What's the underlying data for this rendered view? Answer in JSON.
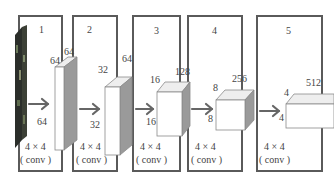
{
  "diagram": {
    "title": "",
    "colors": {
      "frame": "#5a5a5a",
      "cube_face": "#ffffff",
      "cube_side": "#9a9a9a",
      "arrow": "#666666",
      "text": "#444444"
    },
    "input_image": {
      "description": "input image strip (photo)"
    },
    "stages": [
      {
        "index": "1",
        "width_label": "64",
        "height_label": "64",
        "depth_label": "64",
        "kernel": "4 × 4",
        "op": "( conv )"
      },
      {
        "index": "2",
        "width_label": "32",
        "height_label": "32",
        "depth_label": "64",
        "kernel": "4 × 4",
        "op": "( conv )"
      },
      {
        "index": "3",
        "width_label": "16",
        "height_label": "16",
        "depth_label": "128",
        "kernel": "4 × 4",
        "op": "( conv )"
      },
      {
        "index": "4",
        "width_label": "8",
        "height_label": "8",
        "depth_label": "256",
        "kernel": "4 × 4",
        "op": "( conv )"
      },
      {
        "index": "5",
        "width_label": "4",
        "height_label": "4",
        "depth_label": "512",
        "kernel": "4 × 4",
        "op": "( conv )"
      }
    ]
  }
}
